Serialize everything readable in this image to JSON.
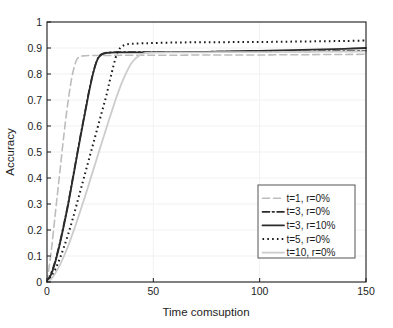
{
  "chart_data": {
    "type": "line",
    "title": "",
    "xlabel": "Time comsuption",
    "ylabel": "Accuracy",
    "xlim": [
      0,
      150
    ],
    "ylim": [
      0,
      1
    ],
    "xticks": [
      "0",
      "50",
      "100",
      "150"
    ],
    "xtick_values": [
      0,
      50,
      100,
      150
    ],
    "yticks": [
      "0",
      "0.1",
      "0.2",
      "0.3",
      "0.4",
      "0.5",
      "0.6",
      "0.7",
      "0.8",
      "0.9",
      "1"
    ],
    "ytick_values": [
      0,
      0.1,
      0.2,
      0.3,
      0.4,
      0.5,
      0.6,
      0.7,
      0.8,
      0.9,
      1
    ],
    "grid": true,
    "grid_color": "#ededed",
    "axis_color": "#1a1a1a",
    "background": "#ffffff",
    "legend_position": "lower-right",
    "x": [
      0,
      2,
      4,
      6,
      8,
      10,
      12,
      14,
      16,
      18,
      20,
      22,
      24,
      26,
      28,
      30,
      33,
      36,
      40,
      45,
      50,
      60,
      70,
      80,
      90,
      100,
      110,
      120,
      130,
      140,
      150
    ],
    "series": [
      {
        "name": "t=1, r=0%",
        "style": "dashed",
        "color": "#bdbdbd",
        "width": 1.6,
        "values": [
          0.0,
          0.12,
          0.27,
          0.42,
          0.57,
          0.7,
          0.8,
          0.855,
          0.868,
          0.87,
          0.871,
          0.871,
          0.871,
          0.871,
          0.871,
          0.871,
          0.872,
          0.872,
          0.872,
          0.872,
          0.872,
          0.872,
          0.873,
          0.873,
          0.873,
          0.873,
          0.874,
          0.874,
          0.875,
          0.875,
          0.876
        ]
      },
      {
        "name": "t=3, r=0%",
        "style": "dashdot",
        "color": "#2b2b2b",
        "width": 1.7,
        "values": [
          0.0,
          0.035,
          0.085,
          0.15,
          0.225,
          0.305,
          0.395,
          0.485,
          0.575,
          0.66,
          0.745,
          0.815,
          0.862,
          0.878,
          0.882,
          0.883,
          0.884,
          0.884,
          0.884,
          0.884,
          0.885,
          0.885,
          0.885,
          0.886,
          0.886,
          0.886,
          0.887,
          0.887,
          0.888,
          0.888,
          0.889
        ]
      },
      {
        "name": "t=3, r=10%",
        "style": "solid",
        "color": "#2b2b2b",
        "width": 1.8,
        "values": [
          0.0,
          0.03,
          0.08,
          0.145,
          0.22,
          0.3,
          0.39,
          0.48,
          0.57,
          0.655,
          0.74,
          0.812,
          0.86,
          0.876,
          0.881,
          0.882,
          0.883,
          0.883,
          0.883,
          0.883,
          0.884,
          0.884,
          0.885,
          0.886,
          0.888,
          0.889,
          0.891,
          0.893,
          0.895,
          0.897,
          0.9
        ]
      },
      {
        "name": "t=5, r=0%",
        "style": "dotted",
        "color": "#1a1a1a",
        "width": 2.0,
        "values": [
          0.0,
          0.02,
          0.05,
          0.09,
          0.135,
          0.185,
          0.24,
          0.3,
          0.36,
          0.42,
          0.48,
          0.54,
          0.6,
          0.66,
          0.72,
          0.79,
          0.88,
          0.91,
          0.916,
          0.918,
          0.919,
          0.921,
          0.922,
          0.922,
          0.923,
          0.923,
          0.924,
          0.925,
          0.926,
          0.927,
          0.929
        ]
      },
      {
        "name": "t=10, r=0%",
        "style": "solid",
        "color": "#cccccc",
        "width": 1.8,
        "values": [
          0.0,
          0.012,
          0.035,
          0.065,
          0.1,
          0.14,
          0.185,
          0.232,
          0.282,
          0.332,
          0.385,
          0.437,
          0.49,
          0.542,
          0.594,
          0.645,
          0.718,
          0.782,
          0.845,
          0.878,
          0.882,
          0.883,
          0.883,
          0.884,
          0.884,
          0.884,
          0.885,
          0.885,
          0.886,
          0.886,
          0.887
        ]
      }
    ],
    "legend_entries": [
      {
        "label": "t=1, r=0%",
        "style": "dashed",
        "color": "#bdbdbd"
      },
      {
        "label": "t=3, r=0%",
        "style": "dashdot",
        "color": "#2b2b2b"
      },
      {
        "label": "t=3, r=10%",
        "style": "solid",
        "color": "#2b2b2b"
      },
      {
        "label": "t=5, r=0%",
        "style": "dotted",
        "color": "#1a1a1a"
      },
      {
        "label": "t=10, r=0%",
        "style": "solid",
        "color": "#cccccc"
      }
    ]
  }
}
